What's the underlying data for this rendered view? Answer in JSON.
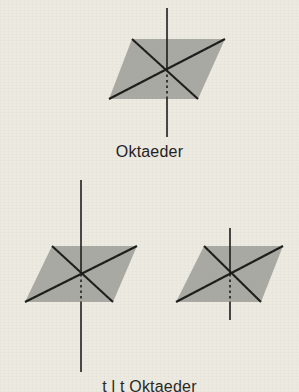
{
  "page": {
    "background_color": "#edeae1",
    "ink_color": "#1b1b19",
    "shape_fill_color": "#a9a9a4",
    "width": 299,
    "height": 392
  },
  "figures": [
    {
      "id": "octahedron-top",
      "name": "Oktaeder",
      "caption": "Oktaeder",
      "shape": "parallelogram",
      "corners": {
        "top_left": [
          132,
          39
        ],
        "top_right": [
          225,
          39
        ],
        "bottom_right": [
          198,
          99
        ],
        "bottom_left": [
          109,
          99
        ]
      },
      "center": [
        167,
        69
      ],
      "axis": {
        "type": "vertical-symmetry-axis",
        "x": 167,
        "y_top": 8,
        "y_bottom": 137
      },
      "diagonals": 2,
      "dotted_segment": "lower-vertical-inside-shape"
    },
    {
      "id": "octahedron-bottom-left",
      "name": "Oktaeder verzerrt links",
      "shape": "parallelogram",
      "corners": {
        "top_left": [
          52,
          246
        ],
        "top_right": [
          137,
          246
        ],
        "bottom_right": [
          113,
          302
        ],
        "bottom_left": [
          25,
          302
        ]
      },
      "center": [
        81,
        274
      ],
      "axis": {
        "type": "vertical-symmetry-axis",
        "x": 81,
        "y_top": 180,
        "y_bottom": 372
      },
      "diagonals": 2,
      "dotted_segment": "lower-vertical-inside-shape"
    },
    {
      "id": "octahedron-bottom-right",
      "name": "Oktaeder verzerrt rechts",
      "shape": "parallelogram",
      "corners": {
        "top_left": [
          204,
          246
        ],
        "top_right": [
          283,
          246
        ],
        "bottom_right": [
          261,
          302
        ],
        "bottom_left": [
          176,
          302
        ]
      },
      "center": [
        230,
        274
      ],
      "axis": {
        "type": "vertical-symmetry-axis",
        "x": 230,
        "y_top": 228,
        "y_bottom": 320
      },
      "diagonals": 2,
      "dotted_segment": "lower-vertical-inside-shape"
    }
  ],
  "captions": {
    "main": "Oktaeder",
    "bottom_cut_off": "t  l   t Oktaeder"
  }
}
